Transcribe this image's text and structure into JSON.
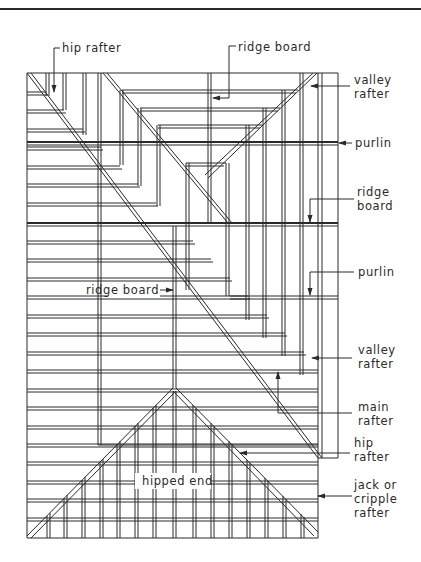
{
  "figure": {
    "type": "roof framing plan",
    "labels": {
      "hip_rafter_top": "hip rafter",
      "ridge_board_top": "ridge board",
      "valley_rafter_top": [
        "valley",
        "rafter"
      ],
      "purlin_upper": "purlin",
      "ridge_board_right": [
        "ridge",
        "board"
      ],
      "purlin_lower": "purlin",
      "ridge_board_left": "ridge board",
      "valley_rafter_bottom": [
        "valley",
        "rafter"
      ],
      "main_rafter": [
        "main",
        "rafter"
      ],
      "hip_rafter_bottom": [
        "hip",
        "rafter"
      ],
      "jack_rafter": [
        "jack or",
        "cripple",
        "rafter"
      ],
      "hipped_end": "hipped end"
    }
  },
  "colors": {
    "line": "#2a2a2a",
    "background": "#ffffff"
  }
}
